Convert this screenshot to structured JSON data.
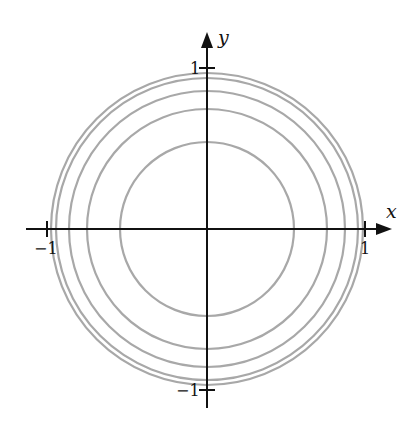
{
  "diagram": {
    "type": "level curves / concentric circles",
    "axes": {
      "x_label": "x",
      "y_label": "y",
      "ticks": {
        "x_neg": "−1",
        "x_pos": "1",
        "y_pos": "1",
        "y_neg": "−1"
      }
    },
    "circle_radii_fraction_of_unit": [
      0.55,
      0.76,
      0.87,
      0.96,
      0.985
    ],
    "colors": {
      "axes": "#111111",
      "circles": "#a8a8a8",
      "background": "#ffffff"
    }
  }
}
